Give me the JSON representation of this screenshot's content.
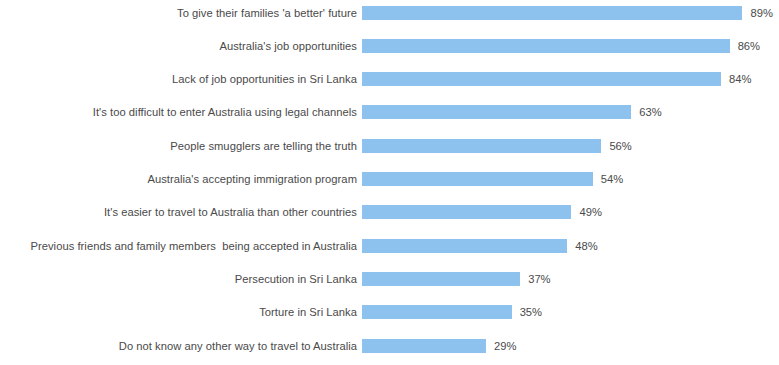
{
  "chart_data": {
    "type": "bar",
    "orientation": "horizontal",
    "title": "",
    "subtitle": "",
    "xlabel": "",
    "ylabel": "",
    "xlim": [
      0,
      100
    ],
    "grid": false,
    "legend": false,
    "legend_position": "none",
    "axis_visible": false,
    "tick_labels_x": [],
    "tick_labels_y": [
      "To give their families 'a better' future",
      "Australia's job opportunities",
      "Lack of job opportunities in Sri Lanka",
      "It's too difficult to enter Australia using legal channels",
      "People smugglers are telling the truth",
      "Australia's accepting immigration program",
      "It's easier to travel to Australia than other countries",
      "Previous friends and family members  being accepted in Australia",
      "Persecution in Sri Lanka",
      "Torture in Sri Lanka",
      "Do not know any other way to travel to Australia"
    ],
    "categories": [
      "To give their families 'a better' future",
      "Australia's job opportunities",
      "Lack of job opportunities in Sri Lanka",
      "It's too difficult to enter Australia using legal channels",
      "People smugglers are telling the truth",
      "Australia's accepting immigration program",
      "It's easier to travel to Australia than other countries",
      "Previous friends and family members  being accepted in Australia",
      "Persecution in Sri Lanka",
      "Torture in Sri Lanka",
      "Do not know any other way to travel to Australia"
    ],
    "values": [
      89,
      86,
      84,
      63,
      56,
      54,
      49,
      48,
      37,
      35,
      29
    ],
    "data_labels": [
      "89%",
      "86%",
      "84%",
      "63%",
      "56%",
      "54%",
      "49%",
      "48%",
      "37%",
      "35%",
      "29%"
    ],
    "series": [
      {
        "name": "",
        "values": [
          89,
          86,
          84,
          63,
          56,
          54,
          49,
          48,
          37,
          35,
          29
        ]
      }
    ],
    "annotations": [],
    "colors": {
      "bar": "#8dc1ee",
      "label_text": "#4a4a4a",
      "value_text": "#4a4a4a",
      "background": "#ffffff"
    }
  }
}
